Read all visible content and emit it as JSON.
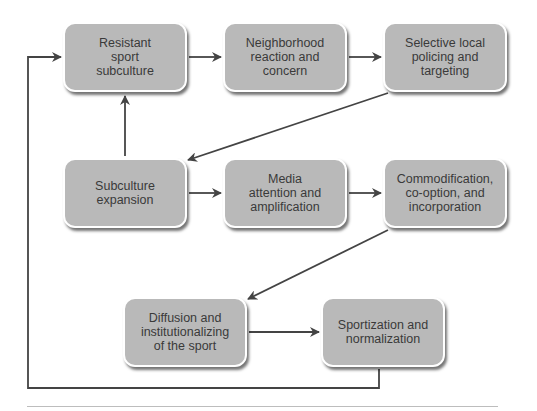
{
  "diagram": {
    "nodes": [
      {
        "id": "resistant",
        "label": "Resistant\nsport\nsubculture"
      },
      {
        "id": "neighborhood",
        "label": "Neighborhood\nreaction and\nconcern"
      },
      {
        "id": "policing",
        "label": "Selective local\npolicing and\ntargeting"
      },
      {
        "id": "expansion",
        "label": "Subculture\nexpansion"
      },
      {
        "id": "media",
        "label": "Media\nattention and\namplification"
      },
      {
        "id": "commodification",
        "label": "Commodification,\nco-option, and\nincorporation"
      },
      {
        "id": "diffusion",
        "label": "Diffusion and\ninstitutionalizing\nof the sport"
      },
      {
        "id": "sportization",
        "label": "Sportization and\nnormalization"
      }
    ],
    "edges": [
      {
        "from": "resistant",
        "to": "neighborhood"
      },
      {
        "from": "neighborhood",
        "to": "policing"
      },
      {
        "from": "policing",
        "to": "expansion"
      },
      {
        "from": "expansion",
        "to": "resistant"
      },
      {
        "from": "expansion",
        "to": "media"
      },
      {
        "from": "media",
        "to": "commodification"
      },
      {
        "from": "commodification",
        "to": "diffusion"
      },
      {
        "from": "diffusion",
        "to": "sportization"
      },
      {
        "from": "sportization",
        "to": "resistant",
        "style": "loop-back"
      }
    ],
    "colors": {
      "box_fill": "#b9b9b9",
      "arrow": "#444444",
      "text": "#3a3a3a"
    }
  }
}
